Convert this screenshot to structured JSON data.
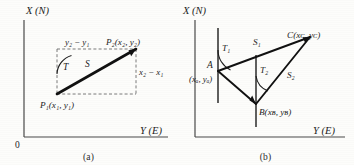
{
  "figure": {
    "type": "technical-diagram",
    "axes": {
      "vertical_label": "X (N)",
      "horizontal_label": "Y (E)",
      "origin_label": "0"
    },
    "panels": [
      {
        "id": "a",
        "caption": "(a)",
        "axis_x_label": "X (N)",
        "axis_y_label": "Y (E)",
        "origin_label": "0",
        "points": [
          {
            "name": "P1",
            "label": "P₁(x₁, y₁)"
          },
          {
            "name": "P2",
            "label": "P₂(x₂, y₂)"
          }
        ],
        "dimensions": [
          {
            "name": "delta-y",
            "label": "y₂ − y₁"
          },
          {
            "name": "delta-x",
            "label": "x₂ − x₁"
          }
        ],
        "angles": [
          {
            "name": "azimuth-T",
            "label": "T"
          }
        ],
        "distances": [
          {
            "name": "distance-S",
            "label": "S"
          }
        ]
      },
      {
        "id": "b",
        "caption": "(b)",
        "axis_x_label": "X (N)",
        "axis_y_label": "Y (E)",
        "points": [
          {
            "name": "A",
            "label": "A",
            "coords": "(xₐ, yₐ)"
          },
          {
            "name": "B",
            "label": "B(xʙ, yʙ)"
          },
          {
            "name": "C",
            "label": "C(xᴄ, yᴄ)"
          }
        ],
        "angles": [
          {
            "name": "azimuth-T1",
            "label": "T₁"
          },
          {
            "name": "azimuth-T2",
            "label": "T₂"
          }
        ],
        "distances": [
          {
            "name": "distance-S1",
            "label": "S₁"
          },
          {
            "name": "distance-S2",
            "label": "S₂"
          }
        ]
      }
    ]
  },
  "colors": {
    "ink": "#1c1c1c",
    "axis": "#555555",
    "paper": "#fdfdfb",
    "dashed": "#6b6b6b"
  }
}
